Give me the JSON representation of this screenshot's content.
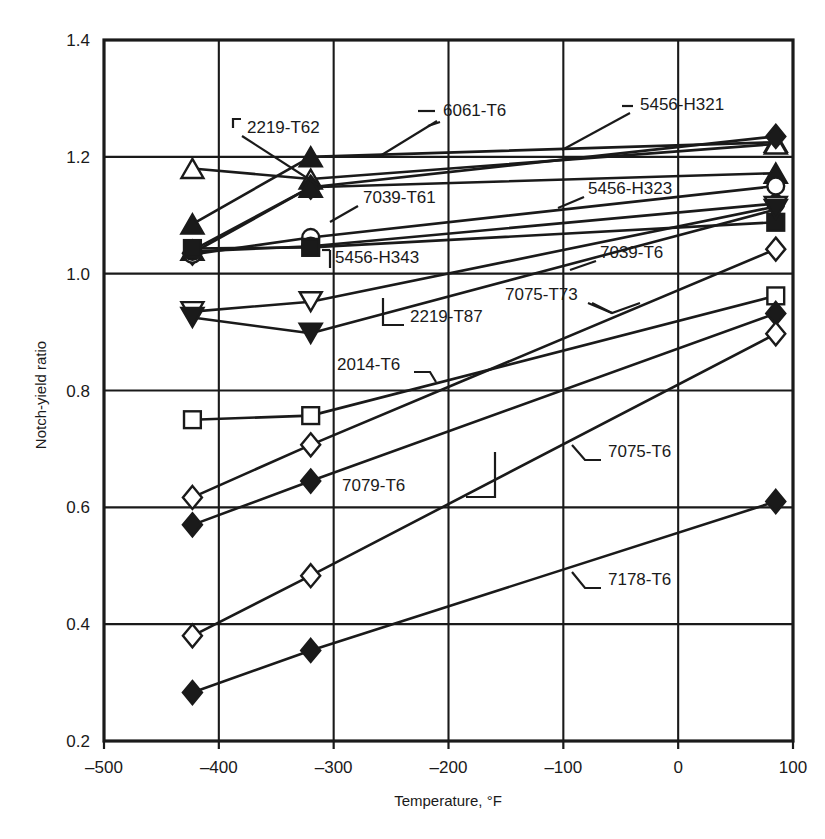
{
  "chart_data": {
    "type": "line",
    "title": "",
    "xlabel": "Temperature, °F",
    "ylabel": "Notch-yield ratio",
    "xlim": [
      -500,
      100
    ],
    "ylim": [
      0.2,
      1.4
    ],
    "xticks": [
      -500,
      -400,
      -300,
      -200,
      -100,
      0,
      100
    ],
    "xtick_labels": [
      "–500",
      "–400",
      "–300",
      "–200",
      "–100",
      "0",
      "100"
    ],
    "yticks": [
      0.2,
      0.4,
      0.6,
      0.8,
      1.0,
      1.2,
      1.4
    ],
    "ytick_labels": [
      "0.2",
      "0.4",
      "0.6",
      "0.8",
      "1.0",
      "1.2",
      "1.4"
    ],
    "grid": true,
    "legend": "inline-annotations",
    "series": [
      {
        "name": "2219-T62",
        "marker": "triangle-up-filled",
        "x": [
          -423,
          -320,
          85
        ],
        "y": [
          1.085,
          1.2,
          1.225
        ]
      },
      {
        "name": "6061-T6",
        "marker": "triangle-up-open",
        "x": [
          -423,
          -320,
          85
        ],
        "y": [
          1.18,
          1.162,
          1.222
        ]
      },
      {
        "name": "5456-H321",
        "marker": "diamond-filled",
        "x": [
          -423,
          -320,
          85
        ],
        "y": [
          1.035,
          1.148,
          1.235
        ]
      },
      {
        "name": "7039-T61",
        "marker": "triangle-up-filled-2",
        "x": [
          -423,
          -320,
          85
        ],
        "y": [
          1.04,
          1.148,
          1.172
        ]
      },
      {
        "name": "5456-H323",
        "marker": "circle-open",
        "x": [
          -423,
          -320,
          85
        ],
        "y": [
          1.033,
          1.062,
          1.15
        ]
      },
      {
        "name": "5456-H343",
        "marker": "circle-filled",
        "x": [
          -423,
          -320,
          85
        ],
        "y": [
          1.038,
          1.047,
          1.12
        ]
      },
      {
        "name": "2219-T87",
        "marker": "triangle-down-open",
        "x": [
          -423,
          -320,
          85
        ],
        "y": [
          0.935,
          0.952,
          1.115
        ]
      },
      {
        "name": "7039-T6",
        "marker": "square-filled",
        "x": [
          -423,
          -320,
          85
        ],
        "y": [
          1.043,
          1.045,
          1.088
        ]
      },
      {
        "name": "7075-T73",
        "marker": "triangle-down-filled",
        "x": [
          -423,
          -320,
          85
        ],
        "y": [
          0.925,
          0.898,
          1.11
        ]
      },
      {
        "name": "2014-T6",
        "marker": "square-open",
        "x": [
          -423,
          -320,
          85
        ],
        "y": [
          0.75,
          0.757,
          0.962
        ]
      },
      {
        "name": "7079-T6",
        "marker": "diamond-open",
        "x": [
          -423,
          -320,
          85
        ],
        "y": [
          0.617,
          0.707,
          1.042
        ]
      },
      {
        "name": "7075-T6",
        "marker": "diamond-filled-2",
        "x": [
          -423,
          -320,
          85
        ],
        "y": [
          0.57,
          0.645,
          0.932
        ]
      },
      {
        "name": "7178-T6",
        "marker": "diamond-filled-3",
        "x": [
          -423,
          -320,
          85
        ],
        "y": [
          0.283,
          0.355,
          0.61
        ]
      },
      {
        "name": "7039-T6b",
        "marker": "diamond-open-2",
        "x": [
          -423,
          -320,
          85
        ],
        "y": [
          0.38,
          0.483,
          0.897
        ]
      }
    ],
    "annotations": [
      {
        "label": "2219-T62",
        "tx": 247,
        "ty": 133,
        "anchor": "start"
      },
      {
        "label": "6061-T6",
        "tx": 443,
        "ty": 116,
        "anchor": "start"
      },
      {
        "label": "5456-H321",
        "tx": 640,
        "ty": 110,
        "anchor": "start"
      },
      {
        "label": "7039-T61",
        "tx": 363,
        "ty": 203,
        "anchor": "start"
      },
      {
        "label": "5456-H323",
        "tx": 588,
        "ty": 194,
        "anchor": "start"
      },
      {
        "label": "5456-H343",
        "tx": 335,
        "ty": 263,
        "anchor": "start"
      },
      {
        "label": "7039-T6",
        "tx": 600,
        "ty": 258,
        "anchor": "start"
      },
      {
        "label": "2219-T87",
        "tx": 410,
        "ty": 322,
        "anchor": "start"
      },
      {
        "label": "7075-T73",
        "tx": 505,
        "ty": 300,
        "anchor": "start"
      },
      {
        "label": "2014-T6",
        "tx": 337,
        "ty": 370,
        "anchor": "start"
      },
      {
        "label": "7079-T6",
        "tx": 342,
        "ty": 491,
        "anchor": "start"
      },
      {
        "label": "7075-T6",
        "tx": 608,
        "ty": 457,
        "anchor": "start"
      },
      {
        "label": "7178-T6",
        "tx": 608,
        "ty": 585,
        "anchor": "start"
      }
    ]
  },
  "colors": {
    "ink": "#1a1a1a",
    "grid": "#111111",
    "background": "#ffffff"
  }
}
